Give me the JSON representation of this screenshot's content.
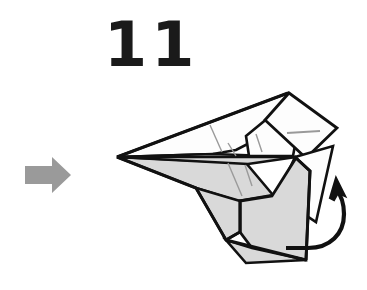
{
  "page": {
    "kind": "origami-folding-instruction",
    "background_color": "#ffffff",
    "width": 367,
    "height": 290
  },
  "step": {
    "number_label": "11",
    "number_color": "#1a1a1a"
  },
  "next_step_arrow": {
    "name": "right-arrow-icon",
    "direction": "right",
    "color": "#9a9a9a",
    "position": {
      "x": 25,
      "y": 157,
      "width": 46,
      "height": 36
    }
  },
  "rotation_arrow": {
    "name": "curved-rotation-arrow-icon",
    "description": "curved arrow indicating flap rotates up and over",
    "color": "#111111",
    "head_direction": "up-left",
    "head_position": {
      "x": 336,
      "y": 186
    }
  },
  "figure": {
    "name": "paper-airplane-diagram",
    "outline_color": "#111111",
    "crease_color": "#9a9a9a",
    "fill_shaded": "#d9d9d9",
    "fill_white": "#fdfdfd",
    "nose_tip": {
      "x": 117,
      "y": 157
    },
    "panels": [
      {
        "id": "upper-wing",
        "shade": "white"
      },
      {
        "id": "lower-wing",
        "shade": "shaded"
      },
      {
        "id": "body-panel",
        "shade": "shaded"
      },
      {
        "id": "rear-flap",
        "shade": "shaded"
      },
      {
        "id": "folded-tab",
        "shade": "white"
      },
      {
        "id": "tail-flap",
        "shade": "white"
      }
    ]
  }
}
